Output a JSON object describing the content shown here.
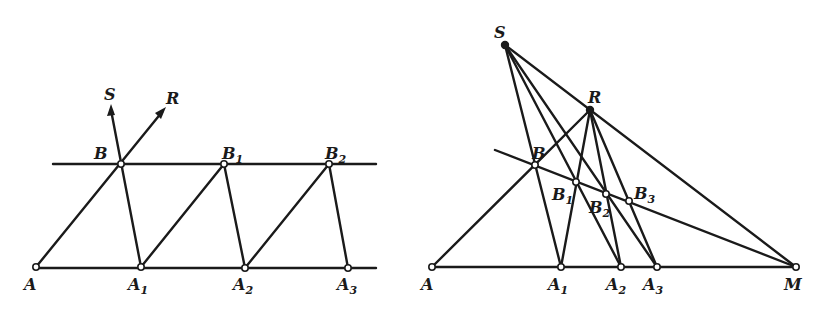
{
  "figure": {
    "left_panel": {
      "description": "Parallel lines construction: segment AA1 repeated via parallelogram-like zigzag",
      "points": {
        "A": {
          "label": "A",
          "sub": "",
          "x": 36,
          "y": 267
        },
        "A1": {
          "label": "A",
          "sub": "1",
          "x": 141,
          "y": 267
        },
        "A2": {
          "label": "A",
          "sub": "2",
          "x": 245,
          "y": 268
        },
        "A3": {
          "label": "A",
          "sub": "3",
          "x": 348,
          "y": 268
        },
        "B": {
          "label": "B",
          "sub": "",
          "x": 121,
          "y": 164
        },
        "B1": {
          "label": "B",
          "sub": "1",
          "x": 224,
          "y": 164
        },
        "B2": {
          "label": "B",
          "sub": "2",
          "x": 329,
          "y": 164
        }
      },
      "arrows": {
        "S": {
          "label": "S",
          "x": 111,
          "y": 108
        },
        "R": {
          "label": "R",
          "x": 164,
          "y": 110
        }
      }
    },
    "right_panel": {
      "description": "Projective (central) version: lines converge to S and R, with vanishing point M on base line",
      "points": {
        "S": {
          "label": "S",
          "sub": "",
          "x": 505,
          "y": 45
        },
        "R": {
          "label": "R",
          "sub": "",
          "x": 590,
          "y": 110
        },
        "A": {
          "label": "A",
          "sub": "",
          "x": 432,
          "y": 267
        },
        "A1": {
          "label": "A",
          "sub": "1",
          "x": 561,
          "y": 267
        },
        "A2": {
          "label": "A",
          "sub": "2",
          "x": 621,
          "y": 267
        },
        "A3": {
          "label": "A",
          "sub": "3",
          "x": 657,
          "y": 267
        },
        "M": {
          "label": "M",
          "sub": "",
          "x": 796,
          "y": 267
        },
        "B": {
          "label": "B",
          "sub": "",
          "x": 535,
          "y": 165
        },
        "B1": {
          "label": "B",
          "sub": "1",
          "x": 576,
          "y": 182
        },
        "B2": {
          "label": "B",
          "sub": "2",
          "x": 606,
          "y": 194
        },
        "B3": {
          "label": "B",
          "sub": "3",
          "x": 629,
          "y": 201
        }
      }
    }
  }
}
